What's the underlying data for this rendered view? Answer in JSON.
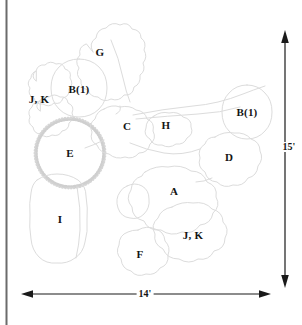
{
  "diagram": {
    "type": "landscape-planting-plan",
    "title": "",
    "background_color": "#ffffff",
    "border": {
      "name": "left-vertical-border",
      "color": "#6b6b6b",
      "orientation": "vertical",
      "x": 6,
      "y_start": 0,
      "y_end": 325,
      "thickness": 2
    },
    "outline_color": "#d8d8d8",
    "label_color": "#141414",
    "plant_labels": [
      {
        "id": "G",
        "text": "G",
        "x": 100,
        "y": 52
      },
      {
        "id": "B1a",
        "text": "B(1)",
        "x": 79,
        "y": 89
      },
      {
        "id": "JKa",
        "text": "J, K",
        "x": 39,
        "y": 99
      },
      {
        "id": "B1b",
        "text": "B(1)",
        "x": 247,
        "y": 112
      },
      {
        "id": "C",
        "text": "C",
        "x": 127,
        "y": 126
      },
      {
        "id": "H",
        "text": "H",
        "x": 166,
        "y": 125
      },
      {
        "id": "E",
        "text": "E",
        "x": 70,
        "y": 153
      },
      {
        "id": "D",
        "text": "D",
        "x": 229,
        "y": 157
      },
      {
        "id": "A",
        "text": "A",
        "x": 174,
        "y": 191
      },
      {
        "id": "I",
        "text": "I",
        "x": 60,
        "y": 219
      },
      {
        "id": "JKb",
        "text": "J, K",
        "x": 193,
        "y": 235
      },
      {
        "id": "F",
        "text": "F",
        "x": 140,
        "y": 254
      }
    ],
    "dimensions": [
      {
        "name": "width-dimension",
        "text": "14'",
        "orientation": "horizontal",
        "label_x": 145,
        "label_y": 294,
        "start": 22,
        "end": 270,
        "axis": 294
      },
      {
        "name": "height-dimension",
        "text": "15'",
        "orientation": "vertical",
        "label_x": 289,
        "label_y": 147,
        "start": 32,
        "end": 286,
        "axis": 285
      }
    ]
  }
}
